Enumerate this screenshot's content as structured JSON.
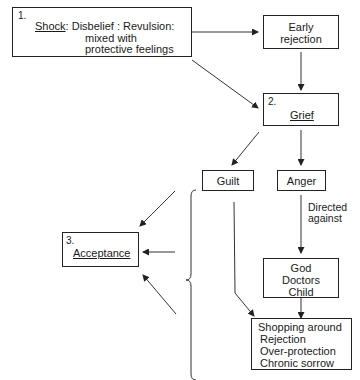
{
  "diagram": {
    "nodes": {
      "shock": {
        "number": "1.",
        "title": "Shock",
        "desc_line1": ": Disbelief : Revulsion:",
        "desc_line2": "mixed with",
        "desc_line3": "protective feelings"
      },
      "early_rejection": {
        "line1": "Early",
        "line2": "rejection"
      },
      "grief": {
        "number": "2.",
        "title": "Grief"
      },
      "guilt": {
        "label": "Guilt"
      },
      "anger": {
        "label": "Anger"
      },
      "targets": {
        "line1": "God",
        "line2": "Doctors",
        "line3": "Child"
      },
      "outcomes": {
        "line1": "Shopping around",
        "line2": "Rejection",
        "line3": "Over-protection",
        "line4": "Chronic sorrow"
      },
      "acceptance": {
        "number": "3.",
        "title": "Acceptance"
      }
    },
    "edge_labels": {
      "directed_against_line1": "Directed",
      "directed_against_line2": "against"
    }
  }
}
